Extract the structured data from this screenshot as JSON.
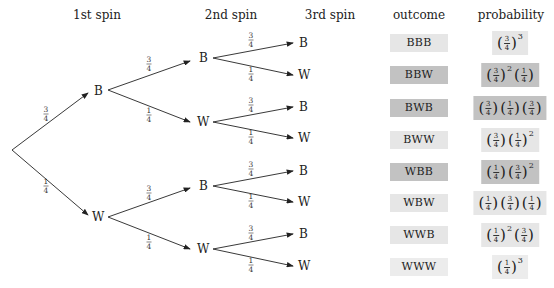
{
  "headers": {
    "spin1": "1st spin",
    "spin2": "2nd spin",
    "spin3": "3rd spin",
    "outcome": "outcome",
    "probability": "probability"
  },
  "tree": {
    "level1": [
      {
        "label": "B",
        "prob": "3/4"
      },
      {
        "label": "W",
        "prob": "1/4"
      }
    ],
    "level2": [
      {
        "label": "B",
        "prob": "3/4"
      },
      {
        "label": "W",
        "prob": "1/4"
      },
      {
        "label": "B",
        "prob": "3/4"
      },
      {
        "label": "W",
        "prob": "1/4"
      }
    ],
    "level3": [
      {
        "label": "B",
        "prob": "3/4"
      },
      {
        "label": "W",
        "prob": "1/4"
      },
      {
        "label": "B",
        "prob": "3/4"
      },
      {
        "label": "W",
        "prob": "1/4"
      },
      {
        "label": "B",
        "prob": "3/4"
      },
      {
        "label": "W",
        "prob": "1/4"
      },
      {
        "label": "B",
        "prob": "3/4"
      },
      {
        "label": "W",
        "prob": "1/4"
      }
    ]
  },
  "outcomes": [
    {
      "label": "BBB",
      "probability": "(3/4)^3",
      "shade": "light"
    },
    {
      "label": "BBW",
      "probability": "(3/4)^2 (1/4)",
      "shade": "dark"
    },
    {
      "label": "BWB",
      "probability": "(3/4) (1/4) (3/4)",
      "shade": "dark"
    },
    {
      "label": "BWW",
      "probability": "(3/4) (1/4)^2",
      "shade": "light"
    },
    {
      "label": "WBB",
      "probability": "(1/4) (3/4)^2",
      "shade": "dark"
    },
    {
      "label": "WBW",
      "probability": "(1/4) (3/4) (1/4)",
      "shade": "light"
    },
    {
      "label": "WWB",
      "probability": "(1/4)^2 (3/4)",
      "shade": "light"
    },
    {
      "label": "WWW",
      "probability": "(1/4)^3",
      "shade": "lightest"
    }
  ],
  "colors": {
    "light": "#e6e6e6",
    "dark": "#c2c2c2",
    "lightest": "#ececec"
  }
}
